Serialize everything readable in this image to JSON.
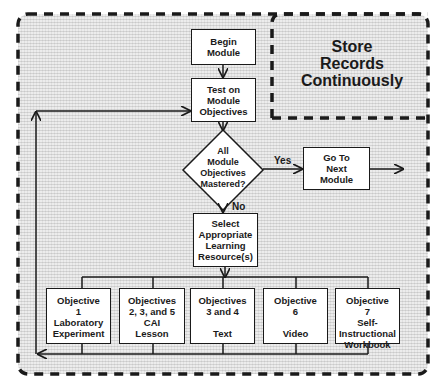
{
  "diagram": {
    "type": "flowchart",
    "store_region": {
      "label": "Store\nRecords\nContinuously"
    },
    "nodes": {
      "begin": {
        "label": "Begin\nModule"
      },
      "test": {
        "label": "Test on\nModule\nObjectives"
      },
      "decision": {
        "label": "All\nModule\nObjectives\nMastered?"
      },
      "next": {
        "label": "Go To\nNext\nModule"
      },
      "select": {
        "label": "Select\nAppropriate\nLearning\nResource(s)"
      },
      "objectives": [
        {
          "label": "Objective\n1\nLaboratory\nExperiment"
        },
        {
          "label": "Objectives\n2, 3, and 5\nCAI\nLesson"
        },
        {
          "label": "Objectives\n3 and 4\n\nText"
        },
        {
          "label": "Objective\n6\n\nVideo"
        },
        {
          "label": "Objective\n7\nSelf-\nInstructional\nWorkbook"
        }
      ]
    },
    "edges": {
      "yes_label": "Yes",
      "no_label": "No"
    },
    "colors": {
      "line": "#1a1a1a",
      "box_fill": "#ffffff",
      "hatch": "#ececec"
    }
  }
}
